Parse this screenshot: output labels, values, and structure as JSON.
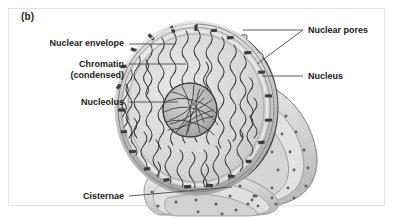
{
  "figure": {
    "panel_letter": "(b)",
    "border_color": "#e3e3e3",
    "background_color": "#ffffff"
  },
  "labels": [
    {
      "id": "nuclear-envelope",
      "text": "Nuclear envelope",
      "align": "right",
      "x": 14,
      "y": 38,
      "width": 110
    },
    {
      "id": "chromatin",
      "text": "Chromatin",
      "align": "right",
      "x": 14,
      "y": 59,
      "width": 110
    },
    {
      "id": "chromatin-sub",
      "text": "(condensed)",
      "align": "right",
      "x": 14,
      "y": 70,
      "width": 110
    },
    {
      "id": "nucleolus",
      "text": "Nucleolus",
      "align": "right",
      "x": 14,
      "y": 97,
      "width": 110
    },
    {
      "id": "cisternae",
      "text": "Cisternae",
      "align": "right",
      "x": 36,
      "y": 191,
      "width": 88
    },
    {
      "id": "nuclear-pores",
      "text": "Nuclear pores",
      "align": "left",
      "x": 308,
      "y": 25,
      "width": 86
    },
    {
      "id": "nucleus",
      "text": "Nucleus",
      "align": "left",
      "x": 308,
      "y": 71,
      "width": 86
    }
  ],
  "leader_lines": [
    {
      "id": "leader-nuclear-envelope",
      "x1": 129,
      "y1": 44,
      "x2": 174,
      "y2": 44
    },
    {
      "id": "leader-chromatin",
      "x1": 129,
      "y1": 64,
      "x2": 186,
      "y2": 64
    },
    {
      "id": "leader-nucleolus",
      "x1": 129,
      "y1": 102,
      "x2": 178,
      "y2": 102
    },
    {
      "id": "leader-cisternae",
      "x1": 129,
      "y1": 196,
      "x2": 232,
      "y2": 187
    },
    {
      "id": "leader-nuclear-pores-a",
      "x1": 303,
      "y1": 30,
      "x2": 243,
      "y2": 30
    },
    {
      "id": "leader-nuclear-pores-b",
      "x1": 303,
      "y1": 30,
      "x2": 257,
      "y2": 64
    },
    {
      "id": "leader-nucleus",
      "x1": 303,
      "y1": 76,
      "x2": 262,
      "y2": 76
    }
  ],
  "colors": {
    "line": "#4a4a4a",
    "text": "#1a1a1a",
    "nucleoplasm": "#d9d9d9",
    "nucleoplasm_shade": "#c6c6c6",
    "envelope_rim": "#cfcfcf",
    "envelope_rim_edge": "#8d8d8d",
    "outer_surface_dark": "#5a5a5a",
    "outer_surface_darker": "#4b4b4b",
    "pore_light": "#d6d6d6",
    "chromatin": "#3a3a3a",
    "nucleolus_mesh": "#454545",
    "nucleolus_fill": "#bdbdbd",
    "cisternae_fill": "#dcdcdc",
    "cisternae_edge": "#9a9a9a",
    "ribosome": "#5f5f5f"
  },
  "structures": [
    {
      "id": "nuclear-envelope",
      "description": "double membrane rim with pore slots around nucleus edge"
    },
    {
      "id": "chromatin-threads",
      "description": "wavy condensed chromatin fibers radiating through nucleoplasm"
    },
    {
      "id": "nucleolus",
      "description": "spherical mesh body near center of nucleus"
    },
    {
      "id": "nuclear-pores",
      "description": "ring-shaped pores studding the dark outer envelope surface"
    },
    {
      "id": "cisternae",
      "description": "stacked rough ER membrane sheets with ribosomes, continuous with envelope"
    }
  ]
}
